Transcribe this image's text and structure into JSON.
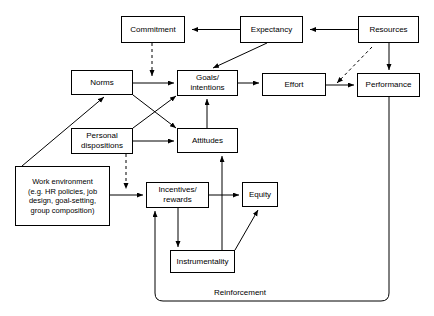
{
  "diagram": {
    "type": "flow-diagram",
    "stroke_color": "#000000",
    "background_color": "#ffffff",
    "nodes": [
      {
        "id": "commitment",
        "label": "Commitment"
      },
      {
        "id": "expectancy",
        "label": "Expectancy"
      },
      {
        "id": "resources",
        "label": "Resources"
      },
      {
        "id": "norms",
        "label": "Norms"
      },
      {
        "id": "goals",
        "label": "Goals/\nintentions"
      },
      {
        "id": "effort",
        "label": "Effort"
      },
      {
        "id": "performance",
        "label": "Performance"
      },
      {
        "id": "dispositions",
        "label": "Personal\ndispositions"
      },
      {
        "id": "attitudes",
        "label": "Attitudes"
      },
      {
        "id": "workenv",
        "label": "Work environment\n(e.g. HR policies, job\ndesign, goal-setting,\ngroup composition)"
      },
      {
        "id": "incentives",
        "label": "Incentives/\nrewards"
      },
      {
        "id": "equity",
        "label": "Equity"
      },
      {
        "id": "instrumentality",
        "label": "Instrumentality"
      }
    ],
    "edge_labels": [
      {
        "id": "reinforcement",
        "label": "Reinforcement"
      }
    ],
    "edges": [
      {
        "from": "expectancy",
        "to": "commitment",
        "style": "solid"
      },
      {
        "from": "resources",
        "to": "expectancy",
        "style": "solid"
      },
      {
        "from": "commitment",
        "to": "goals",
        "style": "dashed"
      },
      {
        "from": "expectancy",
        "to": "goals",
        "style": "solid"
      },
      {
        "from": "norms",
        "to": "goals",
        "style": "solid"
      },
      {
        "from": "norms",
        "to": "attitudes",
        "style": "solid"
      },
      {
        "from": "dispositions",
        "to": "goals",
        "style": "solid"
      },
      {
        "from": "dispositions",
        "to": "attitudes",
        "style": "solid"
      },
      {
        "from": "dispositions",
        "to": "incentives",
        "style": "dashed"
      },
      {
        "from": "attitudes",
        "to": "goals",
        "style": "solid"
      },
      {
        "from": "goals",
        "to": "effort",
        "style": "solid"
      },
      {
        "from": "effort",
        "to": "performance",
        "style": "solid"
      },
      {
        "from": "resources",
        "to": "performance",
        "style": "solid"
      },
      {
        "from": "resources",
        "to": "effort-link",
        "style": "dashed"
      },
      {
        "from": "workenv",
        "to": "norms",
        "style": "solid"
      },
      {
        "from": "workenv",
        "to": "incentives",
        "style": "solid"
      },
      {
        "from": "incentives",
        "to": "equity",
        "style": "solid"
      },
      {
        "from": "incentives",
        "to": "instrumentality",
        "style": "solid"
      },
      {
        "from": "instrumentality",
        "to": "equity",
        "style": "solid"
      },
      {
        "from": "instrumentality",
        "to": "attitudes",
        "style": "solid"
      },
      {
        "from": "performance",
        "to": "incentives",
        "style": "solid",
        "label": "Reinforcement"
      }
    ]
  }
}
